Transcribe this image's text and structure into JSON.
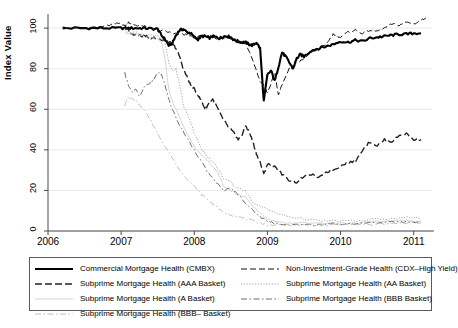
{
  "chart_data": {
    "type": "line",
    "title": "",
    "xlabel": "",
    "ylabel": "Index Value",
    "xlim": [
      2006.0,
      2011.25
    ],
    "ylim": [
      0,
      105
    ],
    "xticks": [
      "2006",
      "2007",
      "2008",
      "2009",
      "2010",
      "2011"
    ],
    "xtick_values": [
      2006,
      2007,
      2008,
      2009,
      2010,
      2011
    ],
    "yticks": [
      "0",
      "20",
      "40",
      "60",
      "80",
      "100"
    ],
    "ytick_values": [
      0,
      20,
      40,
      60,
      80,
      100
    ],
    "grid": "horizontal",
    "legend_position": "below",
    "series": [
      {
        "name": "Commercial Mortgage Health (CMBX)",
        "style": "solid",
        "width": 2.1,
        "color": "#000000",
        "x": [
          2006.2,
          2006.4,
          2006.6,
          2006.8,
          2007.0,
          2007.1,
          2007.2,
          2007.3,
          2007.4,
          2007.5,
          2007.55,
          2007.6,
          2007.65,
          2007.7,
          2007.75,
          2007.8,
          2007.85,
          2007.9,
          2007.95,
          2008.0,
          2008.05,
          2008.1,
          2008.15,
          2008.2,
          2008.25,
          2008.3,
          2008.35,
          2008.4,
          2008.45,
          2008.5,
          2008.55,
          2008.6,
          2008.65,
          2008.7,
          2008.75,
          2008.8,
          2008.85,
          2008.9,
          2008.95,
          2009.0,
          2009.05,
          2009.1,
          2009.15,
          2009.2,
          2009.25,
          2009.3,
          2009.35,
          2009.4,
          2009.45,
          2009.5,
          2009.6,
          2009.7,
          2009.8,
          2009.9,
          2010.0,
          2010.1,
          2010.2,
          2010.3,
          2010.4,
          2010.5,
          2010.6,
          2010.7,
          2010.8,
          2010.9,
          2011.0,
          2011.1
        ],
        "y": [
          100,
          100,
          100,
          100,
          100,
          100,
          100,
          100,
          99.8,
          99.5,
          96.5,
          94.5,
          91.5,
          92.5,
          96.5,
          99,
          99.5,
          98,
          97.5,
          95.5,
          94.5,
          96,
          96,
          95,
          96,
          95.5,
          95,
          96,
          96,
          95.5,
          94,
          93.5,
          93,
          93,
          92,
          91.5,
          93,
          90,
          64,
          77,
          79,
          74,
          81,
          88,
          86,
          83,
          80,
          85,
          87,
          86,
          89,
          90,
          91,
          92,
          93.5,
          93,
          94,
          93.5,
          95,
          95.5,
          96,
          96.5,
          97,
          97,
          97.5,
          97.5
        ]
      },
      {
        "name": "Non-Investment-Grade Health (CDX-High Yield)",
        "style": "dashed-long",
        "width": 1.0,
        "color": "#111111",
        "x": [
          2006.2,
          2006.5,
          2006.8,
          2006.9,
          2007.0,
          2007.05,
          2007.1,
          2007.15,
          2007.2,
          2007.3,
          2007.4,
          2007.5,
          2007.6,
          2007.7,
          2007.8,
          2007.9,
          2008.0,
          2008.1,
          2008.2,
          2008.3,
          2008.4,
          2008.5,
          2008.6,
          2008.7,
          2008.8,
          2008.85,
          2008.9,
          2008.95,
          2009.0,
          2009.1,
          2009.15,
          2009.2,
          2009.3,
          2009.4,
          2009.5,
          2009.6,
          2009.7,
          2009.8,
          2009.9,
          2010.0,
          2010.1,
          2010.2,
          2010.3,
          2010.4,
          2010.5,
          2010.6,
          2010.7,
          2010.8,
          2010.9,
          2011.0,
          2011.1,
          2011.2
        ],
        "y": [
          100,
          100,
          101,
          102,
          102.5,
          101,
          103,
          102,
          101.5,
          101,
          100,
          99,
          98.5,
          97.5,
          97,
          96.5,
          95.5,
          96,
          96,
          95,
          95,
          94.5,
          93,
          93,
          84,
          79,
          74,
          72,
          68,
          78,
          67,
          72,
          80,
          83,
          85,
          88,
          90,
          92,
          97,
          95.5,
          98,
          99,
          97.5,
          99,
          98.5,
          100,
          102,
          101.5,
          103,
          102,
          104,
          105
        ]
      },
      {
        "name": "Subprime Mortgage Health (AAA Basket)",
        "style": "dash-gap",
        "width": 1.4,
        "color": "#222222",
        "x": [
          2007.05,
          2007.1,
          2007.15,
          2007.2,
          2007.25,
          2007.3,
          2007.35,
          2007.4,
          2007.45,
          2007.5,
          2007.55,
          2007.6,
          2007.65,
          2007.7,
          2007.75,
          2007.8,
          2007.85,
          2007.9,
          2007.95,
          2008.0,
          2008.05,
          2008.1,
          2008.15,
          2008.2,
          2008.25,
          2008.3,
          2008.35,
          2008.4,
          2008.45,
          2008.5,
          2008.55,
          2008.6,
          2008.65,
          2008.7,
          2008.75,
          2008.8,
          2008.85,
          2008.9,
          2008.95,
          2009.0,
          2009.1,
          2009.2,
          2009.3,
          2009.4,
          2009.5,
          2009.6,
          2009.7,
          2009.8,
          2009.9,
          2010.0,
          2010.1,
          2010.2,
          2010.3,
          2010.4,
          2010.5,
          2010.6,
          2010.7,
          2010.8,
          2010.9,
          2011.0,
          2011.1
        ],
        "y": [
          100,
          99,
          97,
          97,
          96.5,
          96,
          96,
          95,
          95.5,
          95,
          94,
          93.5,
          93,
          92.5,
          90,
          86,
          80,
          76,
          72,
          70,
          67,
          64,
          60,
          63,
          65,
          62,
          58,
          55,
          52,
          50,
          48,
          45,
          47,
          52,
          49,
          44,
          38,
          34,
          28,
          33,
          32,
          28,
          25,
          24,
          27,
          28,
          26,
          29,
          30,
          32,
          34,
          34,
          40,
          44,
          42,
          45,
          44,
          47,
          48,
          45,
          45
        ]
      },
      {
        "name": "Subprime Mortgage Health (AA Basket)",
        "style": "dotted",
        "width": 0.9,
        "color": "#9a9a9a",
        "x": [
          2007.05,
          2007.1,
          2007.2,
          2007.3,
          2007.4,
          2007.5,
          2007.55,
          2007.6,
          2007.65,
          2007.7,
          2007.75,
          2007.8,
          2007.85,
          2007.9,
          2007.95,
          2008.0,
          2008.05,
          2008.1,
          2008.15,
          2008.2,
          2008.3,
          2008.4,
          2008.5,
          2008.55,
          2008.6,
          2008.7,
          2008.8,
          2008.9,
          2009.0,
          2009.1,
          2009.2,
          2009.3,
          2009.5,
          2009.7,
          2009.9,
          2010.1,
          2010.3,
          2010.5,
          2010.7,
          2010.9,
          2011.0,
          2011.1
        ],
        "y": [
          99,
          98,
          98,
          97,
          96.5,
          96,
          95,
          93,
          83,
          79,
          80,
          72,
          62,
          58,
          54,
          48,
          45,
          40,
          38,
          36,
          32,
          26,
          24,
          22,
          21,
          20,
          14,
          12,
          11,
          9,
          8,
          7,
          6,
          5,
          5,
          5,
          5,
          6,
          6,
          6.5,
          6.5,
          6.5
        ]
      },
      {
        "name": "Subprime Mortgage Health (A Basket)",
        "style": "solid-light",
        "width": 0.9,
        "color": "#cfcfcf",
        "x": [
          2007.05,
          2007.1,
          2007.2,
          2007.3,
          2007.4,
          2007.5,
          2007.55,
          2007.6,
          2007.65,
          2007.7,
          2007.8,
          2007.9,
          2008.0,
          2008.1,
          2008.2,
          2008.3,
          2008.4,
          2008.5,
          2008.6,
          2008.7,
          2008.8,
          2008.9,
          2009.0,
          2009.1,
          2009.3,
          2009.5,
          2009.7,
          2009.9,
          2010.1,
          2010.3,
          2010.5,
          2010.7,
          2010.9,
          2011.1
        ],
        "y": [
          98,
          97,
          97,
          96,
          95,
          95,
          93,
          85,
          70,
          64,
          56,
          48,
          42,
          37,
          34,
          30,
          22,
          20,
          18,
          17,
          12,
          9,
          6,
          5,
          4,
          4,
          4,
          4,
          4,
          4,
          4.5,
          5,
          5,
          5
        ]
      },
      {
        "name": "Subprime Mortgage Health (BBB Basket)",
        "style": "dash-dot",
        "width": 1.0,
        "color": "#6e6e6e",
        "x": [
          2007.05,
          2007.1,
          2007.15,
          2007.2,
          2007.25,
          2007.3,
          2007.35,
          2007.4,
          2007.45,
          2007.5,
          2007.55,
          2007.6,
          2007.65,
          2007.7,
          2007.8,
          2007.9,
          2008.0,
          2008.1,
          2008.2,
          2008.3,
          2008.4,
          2008.5,
          2008.6,
          2008.7,
          2008.8,
          2008.9,
          2009.0,
          2009.1,
          2009.3,
          2009.5,
          2009.7,
          2009.9,
          2010.1,
          2010.3,
          2010.5,
          2010.7,
          2010.9,
          2011.1
        ],
        "y": [
          78,
          72,
          68,
          70,
          66,
          70,
          72,
          73,
          75,
          78,
          77,
          72,
          65,
          60,
          52,
          46,
          40,
          34,
          28,
          24,
          20,
          21,
          18,
          14,
          10,
          7,
          5,
          4,
          3,
          3,
          3,
          3.5,
          3.5,
          4,
          4,
          4.5,
          4.5,
          4.5
        ]
      },
      {
        "name": "Subprime Mortgage Health (BBB- Basket)",
        "style": "dash-dot-light",
        "width": 0.9,
        "color": "#b8b8b8",
        "x": [
          2007.05,
          2007.1,
          2007.2,
          2007.3,
          2007.4,
          2007.5,
          2007.6,
          2007.7,
          2007.8,
          2007.9,
          2008.0,
          2008.1,
          2008.2,
          2008.3,
          2008.4,
          2008.5,
          2008.6,
          2008.7,
          2008.8,
          2008.9,
          2009.0,
          2009.2,
          2009.4,
          2009.6,
          2009.8,
          2010.0,
          2010.3,
          2010.6,
          2010.9,
          2011.1
        ],
        "y": [
          62,
          66,
          64,
          60,
          55,
          48,
          42,
          36,
          30,
          26,
          22,
          18,
          15,
          12,
          9,
          8,
          7,
          6,
          5,
          4,
          3,
          3,
          3,
          3,
          3,
          3,
          3.2,
          3.5,
          4,
          4
        ]
      }
    ]
  },
  "legend": {
    "entries": [
      {
        "label": "Commercial Mortgage Health (CMBX)",
        "style": "solid",
        "column": "left"
      },
      {
        "label": "Subprime Mortgage Health (AAA Basket)",
        "style": "dash-gap",
        "column": "left"
      },
      {
        "label": "Subprime Mortgage Health (A Basket)",
        "style": "solid-light",
        "column": "left"
      },
      {
        "label": "Subprime Mortgage Health (BBB– Basket)",
        "style": "dash-dot-light",
        "column": "left"
      },
      {
        "label": "Non-Investment-Grade Health (CDX–High Yield)",
        "style": "dashed-long",
        "column": "right"
      },
      {
        "label": "Subprime Mortgage Health (AA Basket)",
        "style": "dotted",
        "column": "right"
      },
      {
        "label": "Subprime Mortgage Health (BBB Basket)",
        "style": "dash-dot",
        "column": "right"
      }
    ]
  },
  "colors": {
    "axis": "#4a4a4a",
    "grid": "#e3e3e3",
    "text": "#000000",
    "legend_border": "#5a5a5a"
  }
}
